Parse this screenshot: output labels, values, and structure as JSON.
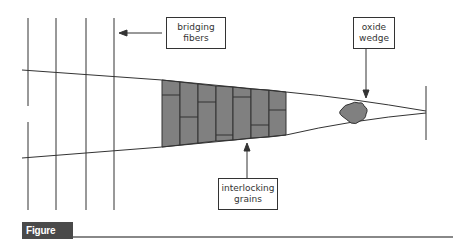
{
  "figure": {
    "label": "Figure 8.26",
    "label_bg": "#4a4a4a",
    "line_color": "#333333",
    "grain_fill": "#808080"
  },
  "callouts": {
    "bridging_fibers": {
      "line1": "bridging",
      "line2": "fibers"
    },
    "oxide_wedge": {
      "line1": "oxide",
      "line2": "wedge"
    },
    "interlocking_grains": {
      "line1": "interlocking",
      "line2": "grains"
    }
  },
  "elements": {
    "fibers_count": 4,
    "grain_columns": 7
  }
}
